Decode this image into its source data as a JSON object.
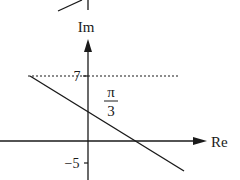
{
  "diagram": {
    "type": "argand-diagram",
    "axes": {
      "imaginary_label": "Im",
      "real_label": "Re"
    },
    "ticks": {
      "upper": "7",
      "lower": "−5"
    },
    "annotation": {
      "numerator": "π",
      "denominator": "3"
    },
    "elements": [
      {
        "kind": "dotted-line",
        "meaning": "horizontal line Im = 7"
      },
      {
        "kind": "solid-line",
        "meaning": "line with negative gradient crossing Im axis and Re axis"
      },
      {
        "kind": "partial-figure",
        "meaning": "cropped fragment of a previous diagram at top"
      }
    ],
    "colors": {
      "ink": "#1a1a1a",
      "background": "#ffffff"
    }
  }
}
